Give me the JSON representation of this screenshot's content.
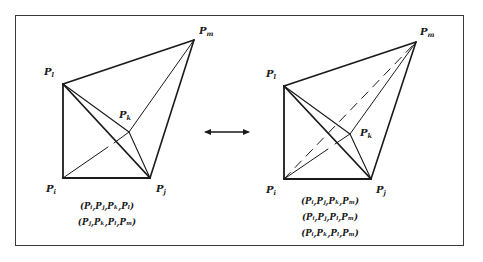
{
  "figure": {
    "left_panel": {
      "vertex_labels": {
        "l": {
          "base": "P",
          "sub": "l"
        },
        "m": {
          "base": "P",
          "sub": "m"
        },
        "k": {
          "base": "P",
          "sub": "k"
        },
        "i": {
          "base": "P",
          "sub": "i"
        },
        "j": {
          "base": "P",
          "sub": "j"
        }
      },
      "tetrahedra": [
        "(Pᵢ,Pⱼ,Pₖ,Pₗ)",
        "(Pⱼ,Pₖ,Pₗ,Pₘ)"
      ]
    },
    "transition_arrow": {
      "icon": "double-arrow-icon",
      "glyph": "↔"
    },
    "right_panel": {
      "vertex_labels": {
        "l": {
          "base": "P",
          "sub": "l"
        },
        "m": {
          "base": "P",
          "sub": "m"
        },
        "k": {
          "base": "P",
          "sub": "k"
        },
        "i": {
          "base": "P",
          "sub": "i"
        },
        "j": {
          "base": "P",
          "sub": "j"
        }
      },
      "tetrahedra": [
        "(Pᵢ,Pⱼ,Pₖ,Pₘ)",
        "(Pᵢ,Pⱼ,Pₗ,Pₘ)",
        "(Pᵢ,Pₖ,Pₗ,Pₘ)"
      ]
    },
    "colors": {
      "ink": "#1a1a1a",
      "frame": "#3a3a3a",
      "background": "#ffffff"
    }
  }
}
